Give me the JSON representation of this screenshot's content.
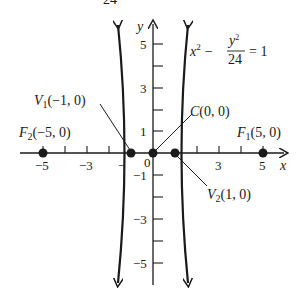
{
  "equation": {
    "lhs_a": "x",
    "lhs_sup": "2",
    "minus": "−",
    "frac_num": "y",
    "frac_num_sup": "2",
    "frac_den": "24",
    "rhs": "= 1",
    "top_fragment": "24"
  },
  "axes": {
    "x_label": "x",
    "y_label": "y"
  },
  "x_ticks": [
    {
      "label": "−5",
      "value": -5
    },
    {
      "label": "−3",
      "value": -3
    },
    {
      "label": "−",
      "value": -1
    },
    {
      "label": "0",
      "value": 0
    },
    {
      "label": "3",
      "value": 3
    },
    {
      "label": "5",
      "value": 5
    }
  ],
  "y_ticks": [
    {
      "label": "5",
      "value": 5
    },
    {
      "label": "3",
      "value": 3
    },
    {
      "label": "1",
      "value": 1
    },
    {
      "label": "−1",
      "value": -1
    },
    {
      "label": "−3",
      "value": -3
    },
    {
      "label": "−5",
      "value": -5
    }
  ],
  "points": {
    "v1": {
      "name": "V",
      "sub": "1",
      "coords": "(−1, 0)"
    },
    "v2": {
      "name": "V",
      "sub": "2",
      "coords": "(1, 0)"
    },
    "c": {
      "name": "C",
      "coords": "(0, 0)"
    },
    "f1": {
      "name": "F",
      "sub": "1",
      "coords": "(5, 0)"
    },
    "f2": {
      "name": "F",
      "sub": "2",
      "coords": "(−5, 0)"
    }
  }
}
